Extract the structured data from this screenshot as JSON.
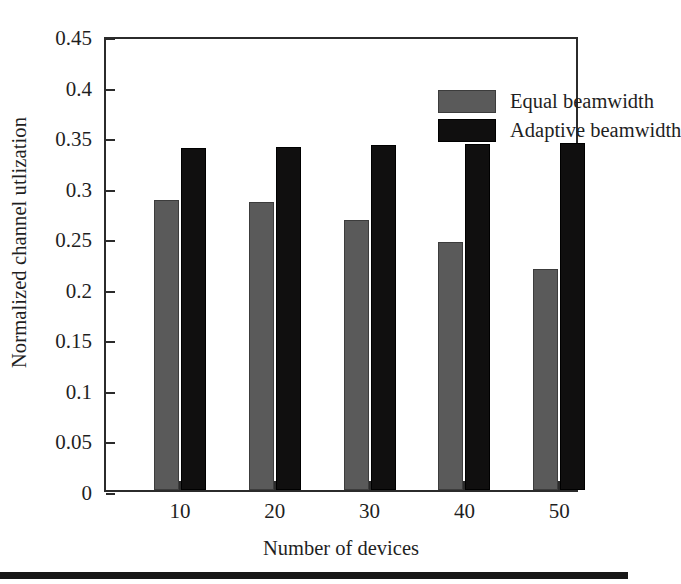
{
  "chart_data": {
    "type": "bar",
    "title": "",
    "xlabel": "Number of devices",
    "ylabel": "Normalized channel utlization",
    "categories": [
      "10",
      "20",
      "30",
      "40",
      "50"
    ],
    "series": [
      {
        "name": "Equal beamwidth",
        "color": "#5a5a5a",
        "values": [
          0.287,
          0.285,
          0.267,
          0.245,
          0.219
        ]
      },
      {
        "name": "Adaptive beamwidth",
        "color": "#100f0f",
        "values": [
          0.338,
          0.339,
          0.341,
          0.342,
          0.343
        ]
      }
    ],
    "ylim": [
      0,
      0.45
    ],
    "yticks": [
      0,
      0.05,
      0.1,
      0.15,
      0.2,
      0.25,
      0.3,
      0.35,
      0.4,
      0.45
    ],
    "ytick_labels": [
      "0",
      "0.05",
      "0.1",
      "0.15",
      "0.2",
      "0.25",
      "0.3",
      "0.35",
      "0.4",
      "0.45"
    ],
    "xtick_labels": [
      "10",
      "20",
      "30",
      "40",
      "50"
    ],
    "grid": false,
    "legend_position": "top-right",
    "legend_entries": [
      "Equal beamwidth",
      "Adaptive beamwidth"
    ],
    "axis_color": "#2b2b2b",
    "background_color": "#ffffff"
  }
}
